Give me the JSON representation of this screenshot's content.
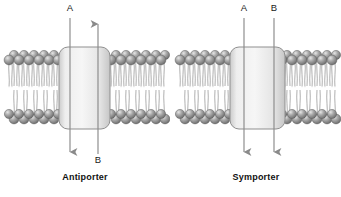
{
  "figure": {
    "background_color": "#ffffff",
    "width": 341,
    "height": 197
  },
  "style": {
    "lipid_head_color": "#8c8c8c",
    "lipid_head_highlight": "#d8d8d8",
    "lipid_head_outline": "#5d5d5d",
    "lipid_tail_color": "#9a9a9a",
    "protein_fill_light": "#f2f2f2",
    "protein_fill_mid": "#e2e2e2",
    "protein_fill_dark": "#cfcfcf",
    "protein_outline": "#8f8f8f",
    "arrow_color": "#8a8a8a",
    "label_color": "#1a1a1a",
    "caption_color": "#111111"
  },
  "panels": [
    {
      "id": "antiporter",
      "caption": "Antiporter",
      "protein": {
        "name": "transport-protein"
      },
      "membrane": {
        "name": "phospholipid-bilayer"
      },
      "arrows": [
        {
          "id": "arrow-a",
          "label": "A",
          "direction": "down",
          "label_position": "top",
          "x": 70,
          "label_x": 70,
          "label_y": 6,
          "line_top": 18,
          "line_bottom": 158,
          "head_y": 158
        },
        {
          "id": "arrow-b",
          "label": "B",
          "direction": "up",
          "label_position": "bottom",
          "x": 98,
          "label_x": 98,
          "label_y": 158,
          "line_top": 18,
          "line_bottom": 154,
          "head_y": 18
        }
      ]
    },
    {
      "id": "symporter",
      "caption": "Symporter",
      "protein": {
        "name": "transport-protein"
      },
      "membrane": {
        "name": "phospholipid-bilayer"
      },
      "arrows": [
        {
          "id": "arrow-a",
          "label": "A",
          "direction": "down",
          "label_position": "top",
          "x": 73,
          "label_x": 73,
          "label_y": 6,
          "line_top": 18,
          "line_bottom": 158,
          "head_y": 158
        },
        {
          "id": "arrow-b",
          "label": "B",
          "direction": "down",
          "label_position": "top",
          "x": 103,
          "label_x": 103,
          "label_y": 6,
          "line_top": 18,
          "line_bottom": 158,
          "head_y": 158
        }
      ]
    }
  ]
}
